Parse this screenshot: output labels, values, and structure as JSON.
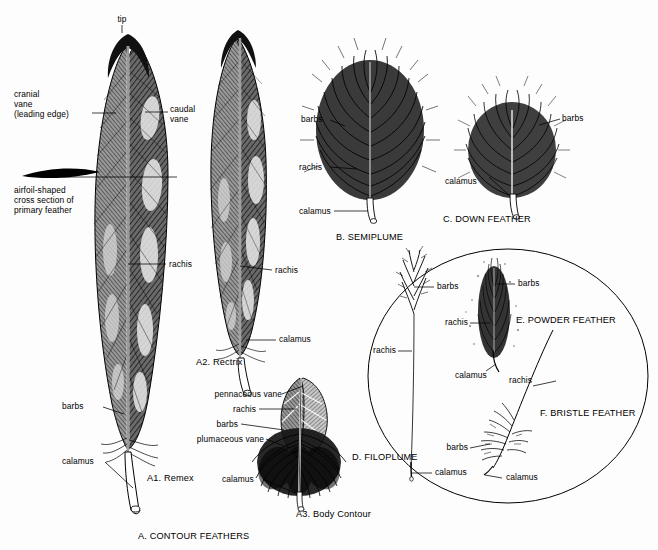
{
  "figure": {
    "background_color": "#fdfdfd",
    "ink_color": "#000000"
  },
  "sections": {
    "a": {
      "heading": "A. CONTOUR FEATHERS",
      "a1": "A1. Remex",
      "a2": "A2. Rectrix",
      "a3": "A3. Body Contour"
    },
    "b": {
      "heading": "B. SEMIPLUME"
    },
    "c": {
      "heading": "C. DOWN FEATHER"
    },
    "d": {
      "heading": "D. FILOPLUME"
    },
    "e": {
      "heading": "E. POWDER FEATHER"
    },
    "f": {
      "heading": "F. BRISTLE FEATHER"
    }
  },
  "labels": {
    "tip": "tip",
    "cranial_vane": "cranial\nvane\n(leading edge)",
    "caudal_vane": "caudal\nvane",
    "airfoil": "airfoil-shaped\ncross section of\nprimary feather",
    "remex_rachis": "rachis",
    "remex_barbs": "barbs",
    "remex_calamus": "calamus",
    "rectrix_rachis": "rachis",
    "rectrix_calamus": "calamus",
    "contour_pennaceous_vane": "pennaceous vane",
    "contour_rachis": "rachis",
    "contour_barbs": "barbs",
    "contour_plumaceous_vane": "plumaceous vane",
    "contour_calamus": "calamus",
    "semiplume_barbs": "barbs",
    "semiplume_rachis": "rachis",
    "semiplume_calamus": "calamus",
    "down_barbs": "barbs",
    "down_calamus": "calamus",
    "filoplume_barbs": "barbs",
    "filoplume_rachis": "rachis",
    "filoplume_calamus": "calamus",
    "powder_barbs": "barbs",
    "powder_rachis": "rachis",
    "powder_calamus": "calamus",
    "bristle_rachis": "rachis",
    "bristle_barbs": "barbs",
    "bristle_calamus": "calamus"
  }
}
